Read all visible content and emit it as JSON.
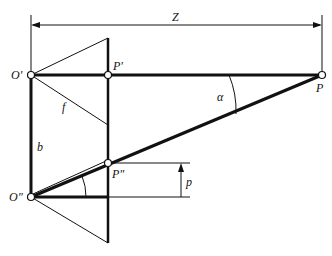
{
  "diagram": {
    "labels": {
      "dimension_top": "Z",
      "origin_upper": "O'",
      "image_point_upper": "P'",
      "object_point": "P",
      "focal_length": "f",
      "angle": "α",
      "baseline": "b",
      "image_point_lower": "P\"",
      "origin_lower": "O\"",
      "parallax": "p"
    },
    "colors": {
      "line": "#111111",
      "background": "#ffffff"
    }
  }
}
